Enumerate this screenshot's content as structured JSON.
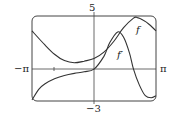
{
  "chart_data": {
    "type": "line",
    "title": "",
    "xlabel": "",
    "ylabel": "",
    "xlim": [
      -3.1416,
      3.1416
    ],
    "ylim": [
      -3,
      5
    ],
    "x_tick_labels": {
      "left": "−π",
      "right": "π"
    },
    "y_tick_labels": {
      "top": "5",
      "bottom": "−3"
    },
    "grid": false,
    "legend": "curve labels inline",
    "series": [
      {
        "name": "f",
        "x": [
          -3.14,
          -2.5,
          -2.0,
          -1.5,
          -1.0,
          -0.5,
          0.0,
          0.5,
          1.0,
          1.5,
          2.0,
          2.2,
          2.5,
          2.8,
          3.14
        ],
        "y": [
          3.6,
          2.3,
          1.4,
          0.8,
          0.6,
          0.75,
          1.0,
          1.6,
          2.6,
          3.9,
          4.8,
          4.85,
          4.6,
          4.2,
          3.6
        ]
      },
      {
        "name": "f'",
        "x": [
          -3.14,
          -2.8,
          -2.5,
          -2.0,
          -1.5,
          -1.0,
          -0.5,
          0.0,
          0.5,
          0.8,
          1.2,
          1.5,
          1.8,
          2.0,
          2.3,
          2.6,
          2.9,
          3.14
        ],
        "y": [
          -2.9,
          -1.9,
          -1.4,
          -0.9,
          -0.6,
          -0.4,
          -0.25,
          0.0,
          1.2,
          2.5,
          3.5,
          3.0,
          1.5,
          0.0,
          -1.5,
          -2.5,
          -2.7,
          -2.5
        ]
      }
    ],
    "annotations": [
      {
        "text": "f",
        "near": "upper right of f curve"
      },
      {
        "text": "f'",
        "near": "below f' peak"
      }
    ]
  },
  "labels": {
    "x_min": "−π",
    "x_max": "π",
    "y_max": "5",
    "y_min": "−3",
    "f": "f",
    "fprime": "f′"
  }
}
